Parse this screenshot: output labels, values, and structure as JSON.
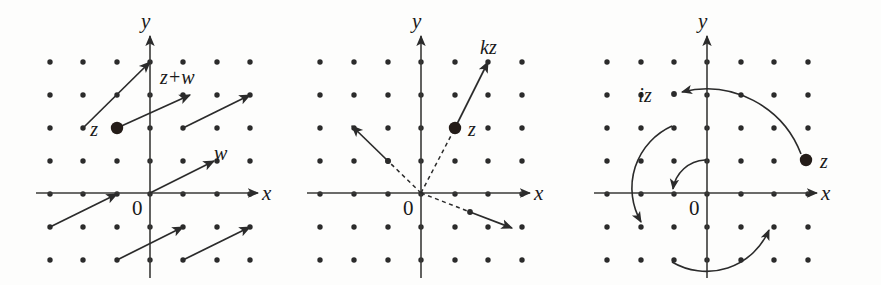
{
  "figure": {
    "background": "#fdfdfc",
    "ink": "#2b2b2b",
    "width": 881,
    "height": 285
  },
  "panels": [
    {
      "id": "addition",
      "caption": "addition of complex numbers as vector translation",
      "origin": {
        "x": 150,
        "y": 193
      },
      "grid": {
        "spacing": 33.3,
        "cols": 7,
        "rows": 7,
        "x_start": -3,
        "y_start": -2
      },
      "axes": {
        "x_label": "x",
        "y_label": "y",
        "origin_label": "0"
      },
      "labels": [
        {
          "name": "z",
          "text": "z",
          "x": 98,
          "y": 135
        },
        {
          "name": "z-plus-w",
          "text": "z+w",
          "x": 160,
          "y": 83
        },
        {
          "name": "w",
          "text": "w",
          "x": 214,
          "y": 158
        }
      ],
      "points": [
        {
          "name": "z",
          "grid_x": -1,
          "grid_y": 2,
          "style": "filled-large"
        }
      ],
      "vectors": [
        {
          "name": "translation-upper-left",
          "x1": 83,
          "y1": 128,
          "x2": 150,
          "y2": 62
        },
        {
          "name": "vector-z-to-z-plus-w",
          "x1": 117,
          "y1": 128,
          "x2": 190,
          "y2": 95
        },
        {
          "name": "translation-upper-right",
          "x1": 183,
          "y1": 128,
          "x2": 250,
          "y2": 95
        },
        {
          "name": "vector-w",
          "x1": 150,
          "y1": 193,
          "x2": 214,
          "y2": 161
        },
        {
          "name": "translation-left",
          "x1": 50,
          "y1": 227,
          "x2": 117,
          "y2": 194
        },
        {
          "name": "translation-lower-mid",
          "x1": 117,
          "y1": 260,
          "x2": 183,
          "y2": 227
        },
        {
          "name": "translation-lower-right",
          "x1": 183,
          "y1": 260,
          "x2": 250,
          "y2": 227
        }
      ]
    },
    {
      "id": "scaling",
      "caption": "multiplication by a real scalar k stretches vectors from the origin",
      "origin": {
        "x": 421,
        "y": 193
      },
      "grid": {
        "spacing": 33.3,
        "cols": 7,
        "rows": 7,
        "x_start": -3,
        "y_start": -2
      },
      "axes": {
        "x_label": "x",
        "y_label": "y",
        "origin_label": "0"
      },
      "labels": [
        {
          "name": "kz",
          "text": "kz",
          "x": 480,
          "y": 52
        },
        {
          "name": "z",
          "text": "z",
          "x": 470,
          "y": 135
        }
      ],
      "points": [
        {
          "name": "z",
          "grid_x": 1,
          "grid_y": 2,
          "style": "filled-large"
        },
        {
          "name": "ray-point-upper-left",
          "grid_x": -1,
          "grid_y": 1,
          "style": "small"
        },
        {
          "name": "ray-point-lower-right",
          "grid_x": 1.5,
          "grid_y": -0.5,
          "style": "small"
        }
      ],
      "vectors": [
        {
          "name": "scaled-vector-kz",
          "x1": 455,
          "y1": 128,
          "x2": 488,
          "y2": 62,
          "style": "solid"
        },
        {
          "name": "ray-origin-to-z",
          "x1": 421,
          "y1": 193,
          "x2": 455,
          "y2": 128,
          "style": "dashed"
        },
        {
          "name": "scaled-vector-upper-left",
          "x1": 388,
          "y1": 161,
          "x2": 352,
          "y2": 126,
          "style": "solid"
        },
        {
          "name": "ray-origin-upper-left",
          "x1": 421,
          "y1": 193,
          "x2": 388,
          "y2": 161,
          "style": "dashed"
        },
        {
          "name": "scaled-vector-lower-right",
          "x1": 470,
          "y1": 212,
          "x2": 512,
          "y2": 228,
          "style": "solid"
        },
        {
          "name": "ray-origin-lower-right",
          "x1": 421,
          "y1": 193,
          "x2": 470,
          "y2": 212,
          "style": "dashed"
        }
      ]
    },
    {
      "id": "rotation",
      "caption": "multiplication by i rotates the plane by a quarter turn",
      "origin": {
        "x": 707,
        "y": 193
      },
      "grid": {
        "spacing": 33.3,
        "cols": 7,
        "rows": 7,
        "x_start": -3,
        "y_start": -2
      },
      "axes": {
        "x_label": "x",
        "y_label": "y",
        "origin_label": "0"
      },
      "labels": [
        {
          "name": "iz",
          "text": "iz",
          "x": 645,
          "y": 101
        },
        {
          "name": "z",
          "text": "z",
          "x": 822,
          "y": 167
        }
      ],
      "points": [
        {
          "name": "z",
          "grid_x": 3,
          "grid_y": 1,
          "style": "filled-large"
        },
        {
          "name": "iz",
          "grid_x": -1,
          "grid_y": 3,
          "style": "small"
        }
      ],
      "arcs": [
        {
          "name": "rotation-arc-outer-z-to-iz",
          "radius": 103
        },
        {
          "name": "rotation-arc-middle",
          "radius": 67
        },
        {
          "name": "rotation-arc-inner",
          "radius": 34
        },
        {
          "name": "rotation-arc-bottom",
          "radius": 67
        }
      ]
    }
  ]
}
